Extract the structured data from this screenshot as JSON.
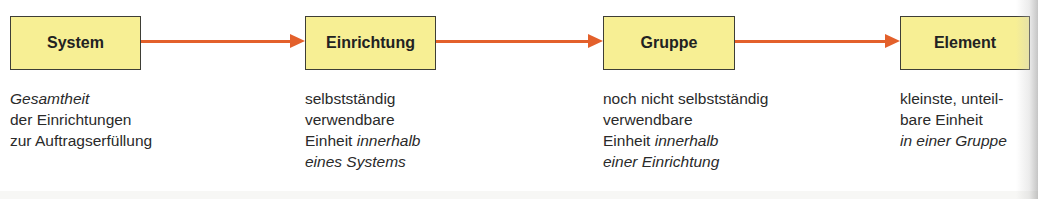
{
  "diagram": {
    "colors": {
      "box_fill": "#f7ef94",
      "box_border": "#3e3e36",
      "arrow": "#e3602b",
      "text": "#2a2a2a"
    },
    "nodes": [
      {
        "label": "System",
        "description": [
          {
            "parts": [
              {
                "text": "Gesamtheit",
                "italic": true
              }
            ]
          },
          {
            "parts": [
              {
                "text": "der Einrichtungen",
                "italic": false
              }
            ]
          },
          {
            "parts": [
              {
                "text": "zur Auftragserfüllung",
                "italic": false
              }
            ]
          }
        ]
      },
      {
        "label": "Einrichtung",
        "description": [
          {
            "parts": [
              {
                "text": "selbstständig",
                "italic": false
              }
            ]
          },
          {
            "parts": [
              {
                "text": "verwendbare",
                "italic": false
              }
            ]
          },
          {
            "parts": [
              {
                "text": "Einheit ",
                "italic": false
              },
              {
                "text": "innerhalb",
                "italic": true
              }
            ]
          },
          {
            "parts": [
              {
                "text": "eines Systems",
                "italic": true
              }
            ]
          }
        ]
      },
      {
        "label": "Gruppe",
        "description": [
          {
            "parts": [
              {
                "text": "noch nicht selbstständig",
                "italic": false
              }
            ]
          },
          {
            "parts": [
              {
                "text": "verwendbare",
                "italic": false
              }
            ]
          },
          {
            "parts": [
              {
                "text": "Einheit ",
                "italic": false
              },
              {
                "text": "innerhalb",
                "italic": true
              }
            ]
          },
          {
            "parts": [
              {
                "text": "einer Einrichtung",
                "italic": true
              }
            ]
          }
        ]
      },
      {
        "label": "Element",
        "description": [
          {
            "parts": [
              {
                "text": "kleinste, unteil-",
                "italic": false
              }
            ]
          },
          {
            "parts": [
              {
                "text": "bare Einheit",
                "italic": false
              }
            ]
          },
          {
            "parts": [
              {
                "text": "in einer Gruppe",
                "italic": true
              }
            ]
          }
        ]
      }
    ],
    "edges": [
      {
        "from": "System",
        "to": "Einrichtung"
      },
      {
        "from": "Einrichtung",
        "to": "Gruppe"
      },
      {
        "from": "Gruppe",
        "to": "Element"
      }
    ]
  }
}
